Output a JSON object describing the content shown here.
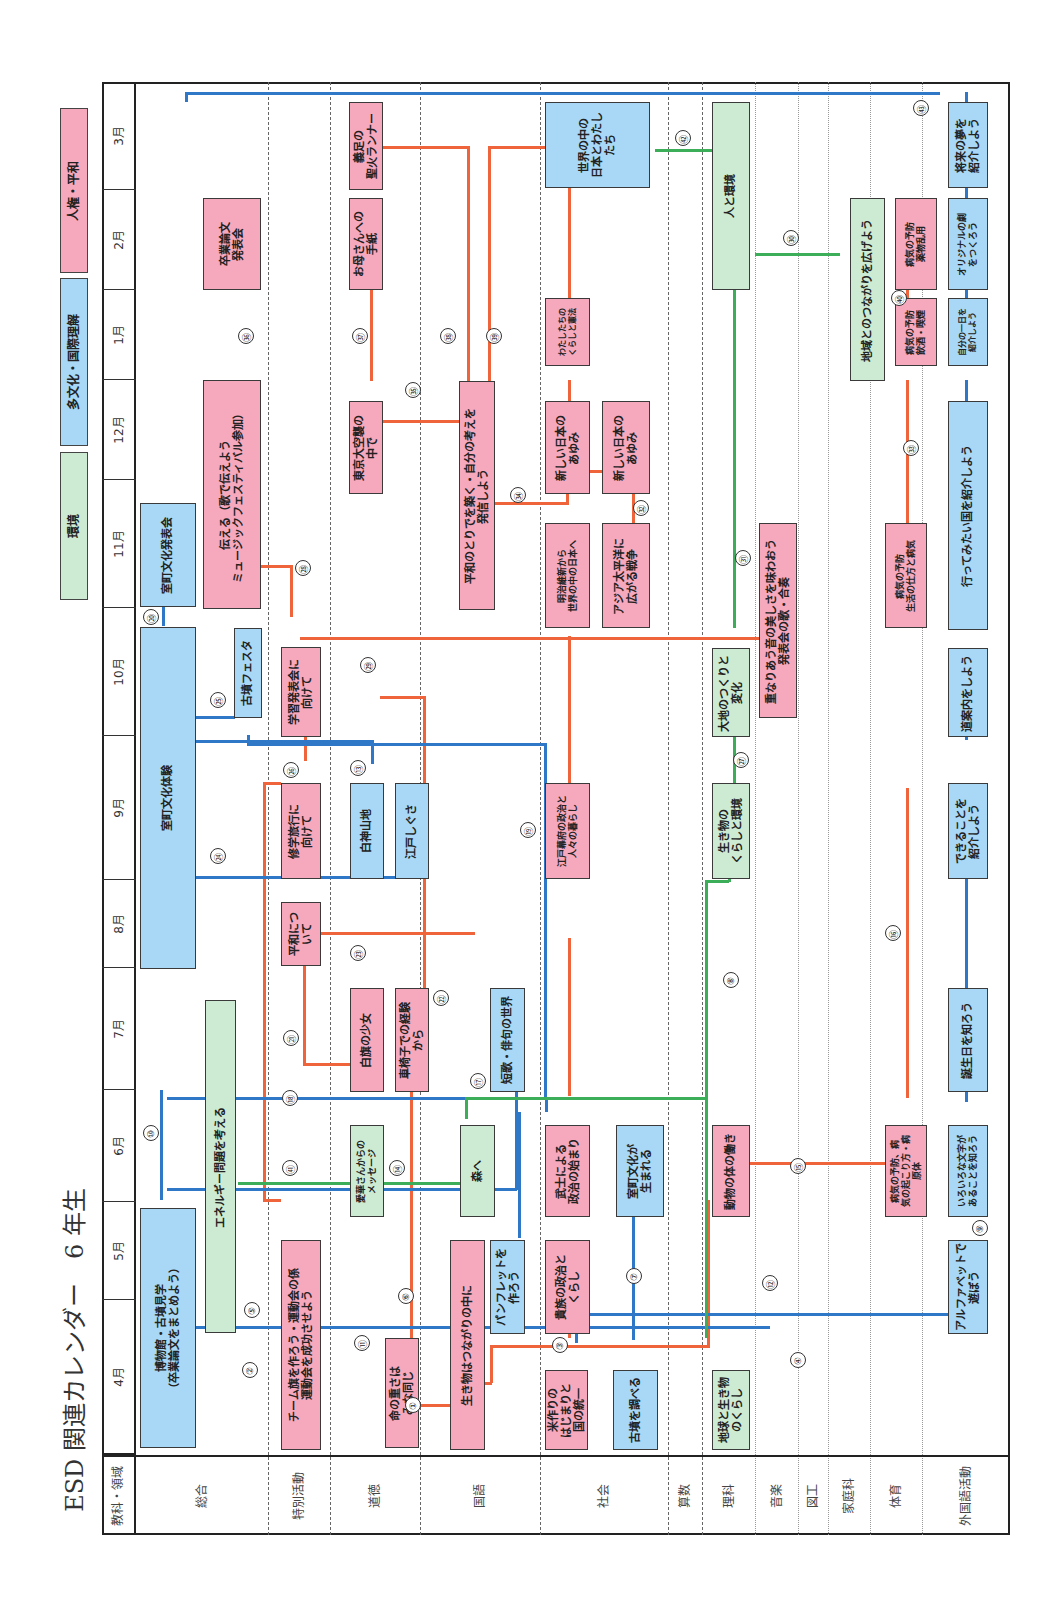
{
  "title": "ESD 関連カレンダー　6 年生",
  "legend": [
    {
      "label": "人権・平和",
      "color": "#f6a8bd"
    },
    {
      "label": "多文化・国際理解",
      "color": "#a8d8f5"
    },
    {
      "label": "環境",
      "color": "#cdebd2"
    }
  ],
  "header": {
    "corner_label": "教科・領域"
  },
  "months": [
    "3月",
    "2月",
    "1月",
    "12月",
    "11月",
    "10月",
    "9月",
    "8月",
    "7月",
    "6月",
    "5月",
    "4月"
  ],
  "subjects": [
    "総合",
    "特別活動",
    "道徳",
    "国語",
    "社会",
    "算数",
    "理科",
    "音楽",
    "図工",
    "家庭科",
    "体育",
    "外国語活動"
  ],
  "activities": {
    "sogo_1": "博物館・古墳見学\n（卒業論文をまとめよう）",
    "sogo_2": "室町文化体験",
    "sogo_3": "室町文化発表会",
    "sogo_4": "古墳フェスタ",
    "sogo_5": "伝える（歌で伝えよう\nミュージックフェスティバル参加）",
    "sogo_6": "卒業論文\n発表会",
    "sogo_7": "エネルギー問題を考える",
    "tokkatsu_1": "チーム旗を作ろう・運動会の係\n運動会を成功させよう",
    "tokkatsu_2": "修学旅行に\n向けて",
    "tokkatsu_3": "平和につ\nいて",
    "tokkatsu_4": "学習発表会に\n向けて",
    "dotoku_1": "命の重さは\nみな同じ",
    "dotoku_2": "愛華さんからの\nメッセージ",
    "dotoku_3": "白旗の少女",
    "dotoku_4": "白神山地",
    "dotoku_5": "東京大空襲の\n中で",
    "dotoku_6": "お母さんへの\n手紙",
    "dotoku_7": "義足の\n聖火ランナー",
    "kokugo_1": "生き物はつながりの中に",
    "kokugo_2": "森へ",
    "kokugo_3": "車椅子での経験\nから",
    "kokugo_4": "江戸しぐさ",
    "kokugo_5": "パンフレットを\n作ろう",
    "kokugo_6": "短歌・俳句の世界",
    "kokugo_7": "平和のとりでを築く・自分の考えを\n発信しよう",
    "shakai_1": "米作りの\nはじまりと\n国の統一",
    "shakai_2": "古墳を調べる",
    "shakai_3": "貴族の政治と\nくらし",
    "shakai_4": "武士による\n政治の始まり",
    "shakai_5": "室町文化が\n生まれる",
    "shakai_6": "江戸幕府の政治と\n人々の暮らし",
    "shakai_7": "明治維新から\n世界の中の日本へ",
    "shakai_8": "アジア太平洋に\n広がる戦争",
    "shakai_9": "新しい日本の\nあゆみ",
    "shakai_10": "新しい日本の\nあゆみ",
    "shakai_11": "わたしたちの\nくらしと憲法",
    "shakai_12": "世界の中の\n日本とわたし\nたち",
    "rika_1": "地球と生き物\nのくらし",
    "rika_2": "動物の体の働き",
    "rika_3": "生き物の\nくらしと環境",
    "rika_4": "大地のつくりと\n変化",
    "rika_5": "人と環境",
    "ongaku_1": "重なりあう音の美しさを味わおう\n発表会の歌・合奏",
    "katei_1": "地域とのつながりを広げよう",
    "taiiku_1": "病気の予防、病\n気の起こり方・病\n原体",
    "taiiku_2": "病気の予防\n生活の仕方と病気",
    "taiiku_3": "病気の予防\n飲酒・喫煙",
    "taiiku_4": "病気の予防\n薬物乱用",
    "gaikoku_1": "アルファベットで\n遊ぼう",
    "gaikoku_2": "いろいろな文字が\nあることを知ろう",
    "gaikoku_3": "誕生日を知ろう",
    "gaikoku_4": "できることを\n紹介しよう",
    "gaikoku_5": "道案内をしよう",
    "gaikoku_6": "行ってみたい国を紹介しよう",
    "gaikoku_7": "自分の一日を\n紹介しよう",
    "gaikoku_8": "オリジナルの劇\nをつくろう",
    "gaikoku_9": "将来の夢を\n紹介しよう"
  },
  "link_numbers": [
    "①",
    "②",
    "③",
    "④",
    "⑤",
    "⑥",
    "⑦",
    "⑧",
    "⑨",
    "⑩",
    "⑪",
    "⑫",
    "⑬",
    "⑭",
    "⑮",
    "⑯",
    "⑰",
    "⑱",
    "⑲",
    "⑳",
    "㉑",
    "㉒",
    "㉓",
    "㉔",
    "㉕",
    "㉖",
    "㉗",
    "㉘",
    "㉙",
    "㉚",
    "㉛",
    "㉜",
    "㉝",
    "㉞",
    "㉟",
    "㊱",
    "㊲",
    "㊳",
    "㊴",
    "㊵",
    "㊶",
    "㊷",
    "㊸"
  ],
  "colors": {
    "human_rights": "#f6a8bd",
    "multicultural": "#a8d8f5",
    "environment": "#cdebd2",
    "line_orange": "#f0643c",
    "line_blue": "#2f78c8",
    "line_green": "#3cae5a"
  }
}
